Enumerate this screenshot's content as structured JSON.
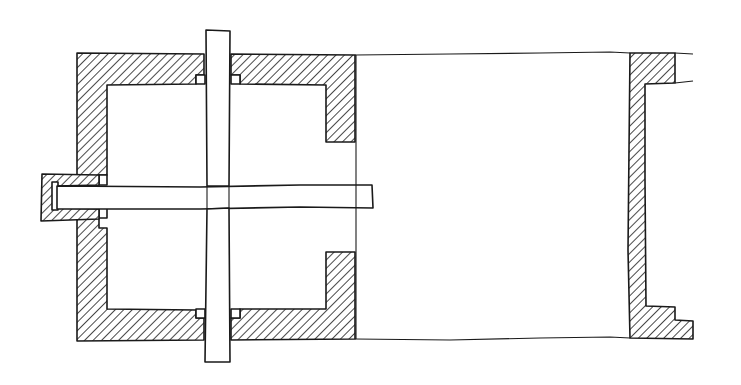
{
  "diagram": {
    "type": "mechanical-cross-section",
    "style": "hand-drawn technical sketch",
    "colors": {
      "line": "#1a1a1a",
      "background": "#ffffff",
      "hatch": "#1a1a1a"
    },
    "components": [
      {
        "name": "left-housing",
        "hatched": true
      },
      {
        "name": "vertical-shaft",
        "hatched": false
      },
      {
        "name": "horizontal-shaft",
        "hatched": false
      },
      {
        "name": "left-end-bearing-cap",
        "hatched": true
      },
      {
        "name": "top-shaft-seals",
        "hatched": false
      },
      {
        "name": "bottom-shaft-seals",
        "hatched": false
      },
      {
        "name": "connecting-tube",
        "hatched": false
      },
      {
        "name": "right-flange",
        "hatched": true
      }
    ]
  }
}
